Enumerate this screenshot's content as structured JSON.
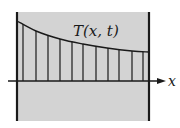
{
  "diagram": {
    "title_label": "T(x, t)",
    "axis_label": "x",
    "colors": {
      "background": "#ffffff",
      "slab_fill": "#d3d3d3",
      "stroke": "#1a1a1a"
    },
    "slab": {
      "left": 17,
      "right": 149,
      "top": 12,
      "bottom": 121
    },
    "axis": {
      "y": 81,
      "x_start": 8,
      "x_end": 165
    },
    "curve_points": [
      [
        17,
        21
      ],
      [
        36,
        31
      ],
      [
        60,
        39
      ],
      [
        83,
        44
      ],
      [
        107,
        48
      ],
      [
        132,
        51
      ],
      [
        149,
        52
      ]
    ],
    "hatch_x": [
      23,
      36,
      48,
      60,
      72,
      83,
      96,
      108,
      119,
      132,
      143
    ]
  }
}
